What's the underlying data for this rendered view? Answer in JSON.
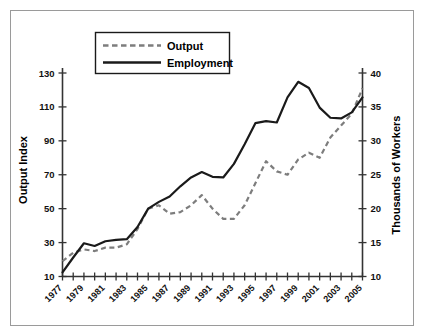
{
  "chart_data": {
    "type": "line",
    "title": "",
    "xlabel": "",
    "ylabel": "Output Index",
    "y2label": "Thousands of Workers",
    "grid": false,
    "legend_position": "top-left",
    "xlim": [
      1977,
      2005
    ],
    "ylim": [
      10,
      130
    ],
    "y2lim": [
      10,
      40
    ],
    "x": [
      1977,
      1978,
      1979,
      1980,
      1981,
      1982,
      1983,
      1984,
      1985,
      1986,
      1987,
      1988,
      1989,
      1990,
      1991,
      1992,
      1993,
      1994,
      1995,
      1996,
      1997,
      1998,
      1999,
      2000,
      2001,
      2002,
      2003,
      2004,
      2005
    ],
    "xticks": [
      1977,
      1979,
      1981,
      1983,
      1985,
      1987,
      1989,
      1991,
      1993,
      1995,
      1997,
      1999,
      2001,
      2003,
      2005
    ],
    "xtick_labels": [
      "1977",
      "1979",
      "1981",
      "1983",
      "1985",
      "1987",
      "1989",
      "1991",
      "1993",
      "1995",
      "1997",
      "1999",
      "2001",
      "2003",
      "2005"
    ],
    "yticks": [
      10,
      30,
      50,
      70,
      90,
      110,
      130
    ],
    "ytick_labels": [
      "10",
      "30",
      "50",
      "70",
      "90",
      "110",
      "130"
    ],
    "y2ticks": [
      10,
      15,
      20,
      25,
      30,
      35,
      40
    ],
    "y2tick_labels": [
      "10",
      "15",
      "20",
      "25",
      "30",
      "35",
      "40"
    ],
    "series": [
      {
        "name": "Output",
        "axis": "left",
        "style": "dashed",
        "color": "#7d7d7d",
        "values": [
          19,
          24,
          26,
          25,
          27,
          27,
          29,
          38,
          50,
          52,
          47,
          48,
          52,
          58,
          50,
          44,
          44,
          52,
          65,
          78,
          72,
          70,
          79,
          83,
          80,
          92,
          99,
          106,
          121
        ]
      },
      {
        "name": "Employment",
        "axis": "right",
        "style": "solid",
        "color": "#1a1a1a",
        "values_right": [
          10.6,
          12.8,
          14.9,
          14.5,
          15.2,
          15.4,
          15.5,
          17.3,
          20.0,
          21.0,
          21.8,
          23.3,
          24.6,
          25.4,
          24.7,
          24.6,
          26.6,
          29.5,
          32.6,
          32.9,
          32.7,
          36.4,
          38.7,
          37.8,
          34.9,
          33.4,
          33.3,
          34.2,
          36.4
        ],
        "values_left_equivalent": [
          12,
          21,
          30,
          28,
          31,
          32,
          32,
          39,
          50,
          54,
          57,
          63,
          68,
          71,
          68,
          68,
          76,
          88,
          100,
          101,
          100,
          115,
          124,
          120,
          108,
          102,
          102,
          105,
          115
        ]
      }
    ]
  },
  "legend": {
    "entries": [
      {
        "label": "Output",
        "style": "dashed",
        "color": "#7d7d7d"
      },
      {
        "label": "Employment",
        "style": "solid",
        "color": "#1a1a1a"
      }
    ]
  },
  "axes": {
    "left_title": "Output Index",
    "right_title": "Thousands of Workers"
  },
  "colors": {
    "frame": "#9a9a9a",
    "axis": "#333333",
    "output": "#7d7d7d",
    "employment": "#1a1a1a",
    "background": "#ffffff"
  }
}
